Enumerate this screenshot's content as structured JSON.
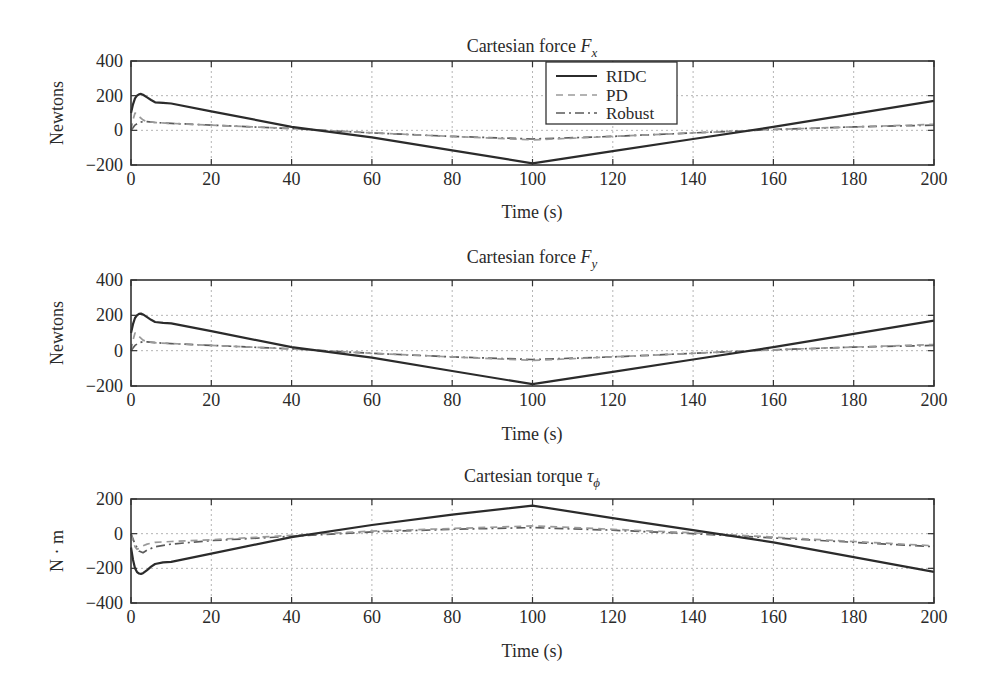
{
  "chart_data": [
    {
      "type": "line",
      "title": "Cartesian force F_x",
      "title_main": "Cartesian force ",
      "title_symbol": "F",
      "title_subscript": "x",
      "xlabel": "Time (s)",
      "ylabel": "Newtons",
      "xlim": [
        0,
        200
      ],
      "ylim": [
        -200,
        400
      ],
      "xticks": [
        0,
        20,
        40,
        60,
        80,
        100,
        120,
        140,
        160,
        180,
        200
      ],
      "yticks": [
        -200,
        0,
        200,
        400
      ],
      "ytick_labels": [
        "−200",
        "0",
        "200",
        "400"
      ],
      "grid": true,
      "legend": {
        "position": "upper center",
        "entries": [
          "RIDC",
          "PD",
          "Robust"
        ]
      },
      "series": [
        {
          "name": "RIDC",
          "style": "solid",
          "color": "#2b2b2b",
          "x": [
            0,
            0.5,
            1,
            1.5,
            2,
            2.5,
            3,
            4,
            5,
            6,
            8,
            10,
            20,
            40,
            60,
            80,
            100,
            120,
            140,
            160,
            180,
            200
          ],
          "y": [
            100,
            150,
            185,
            200,
            208,
            210,
            205,
            190,
            175,
            162,
            158,
            155,
            110,
            20,
            -40,
            -115,
            -190,
            -120,
            -50,
            20,
            95,
            170
          ]
        },
        {
          "name": "PD",
          "style": "dashed",
          "color": "#9a9a9a",
          "x": [
            0,
            0.5,
            1,
            1.5,
            2,
            3,
            4,
            6,
            10,
            20,
            40,
            60,
            80,
            100,
            120,
            140,
            160,
            180,
            200
          ],
          "y": [
            0,
            60,
            100,
            95,
            80,
            60,
            50,
            45,
            40,
            30,
            10,
            -15,
            -35,
            -55,
            -35,
            -15,
            5,
            20,
            35
          ]
        },
        {
          "name": "Robust",
          "style": "dashdot",
          "color": "#5a5a5a",
          "x": [
            0,
            0.5,
            1,
            2,
            3,
            4,
            6,
            10,
            20,
            40,
            60,
            80,
            100,
            120,
            140,
            160,
            180,
            200
          ],
          "y": [
            0,
            15,
            30,
            45,
            50,
            50,
            45,
            40,
            30,
            10,
            -15,
            -35,
            -50,
            -35,
            -15,
            5,
            20,
            30
          ]
        }
      ]
    },
    {
      "type": "line",
      "title": "Cartesian force F_y",
      "title_main": "Cartesian force ",
      "title_symbol": "F",
      "title_subscript": "y",
      "xlabel": "Time (s)",
      "ylabel": "Newtons",
      "xlim": [
        0,
        200
      ],
      "ylim": [
        -200,
        400
      ],
      "xticks": [
        0,
        20,
        40,
        60,
        80,
        100,
        120,
        140,
        160,
        180,
        200
      ],
      "yticks": [
        -200,
        0,
        200,
        400
      ],
      "ytick_labels": [
        "−200",
        "0",
        "200",
        "400"
      ],
      "grid": true,
      "series": [
        {
          "name": "RIDC",
          "style": "solid",
          "color": "#2b2b2b",
          "x": [
            0,
            0.5,
            1,
            1.5,
            2,
            2.5,
            3,
            4,
            5,
            6,
            8,
            10,
            20,
            40,
            60,
            80,
            100,
            120,
            140,
            160,
            180,
            200
          ],
          "y": [
            100,
            150,
            185,
            200,
            208,
            210,
            205,
            190,
            175,
            162,
            158,
            155,
            110,
            20,
            -40,
            -115,
            -190,
            -120,
            -50,
            20,
            95,
            170
          ]
        },
        {
          "name": "PD",
          "style": "dashed",
          "color": "#9a9a9a",
          "x": [
            0,
            0.5,
            1,
            1.5,
            2,
            3,
            4,
            6,
            10,
            20,
            40,
            60,
            80,
            100,
            120,
            140,
            160,
            180,
            200
          ],
          "y": [
            0,
            60,
            100,
            95,
            80,
            60,
            50,
            45,
            40,
            30,
            10,
            -15,
            -35,
            -55,
            -35,
            -15,
            5,
            20,
            35
          ]
        },
        {
          "name": "Robust",
          "style": "dashdot",
          "color": "#5a5a5a",
          "x": [
            0,
            0.5,
            1,
            2,
            3,
            4,
            6,
            10,
            20,
            40,
            60,
            80,
            100,
            120,
            140,
            160,
            180,
            200
          ],
          "y": [
            0,
            15,
            30,
            45,
            50,
            50,
            45,
            40,
            30,
            10,
            -15,
            -35,
            -50,
            -35,
            -15,
            5,
            20,
            30
          ]
        }
      ]
    },
    {
      "type": "line",
      "title": "Cartesian torque τ_ϕ",
      "title_main": "Cartesian torque ",
      "title_symbol": "τ",
      "title_subscript": "ϕ",
      "xlabel": "Time (s)",
      "ylabel": "N · m",
      "xlim": [
        0,
        200
      ],
      "ylim": [
        -400,
        200
      ],
      "xticks": [
        0,
        20,
        40,
        60,
        80,
        100,
        120,
        140,
        160,
        180,
        200
      ],
      "yticks": [
        -400,
        -200,
        0,
        200
      ],
      "ytick_labels": [
        "−400",
        "−200",
        "0",
        "200"
      ],
      "grid": true,
      "series": [
        {
          "name": "RIDC",
          "style": "solid",
          "color": "#2b2b2b",
          "x": [
            0,
            0.5,
            1,
            1.5,
            2,
            2.5,
            3,
            4,
            5,
            6,
            8,
            10,
            20,
            40,
            60,
            80,
            100,
            120,
            140,
            160,
            180,
            200
          ],
          "y": [
            -80,
            -150,
            -200,
            -222,
            -230,
            -232,
            -228,
            -210,
            -190,
            -175,
            -165,
            -163,
            -115,
            -20,
            50,
            110,
            162,
            90,
            20,
            -50,
            -135,
            -220
          ]
        },
        {
          "name": "PD",
          "style": "dashed",
          "color": "#9a9a9a",
          "x": [
            0,
            0.5,
            1,
            1.5,
            2,
            3,
            4,
            6,
            10,
            20,
            40,
            60,
            80,
            100,
            120,
            140,
            160,
            180,
            200
          ],
          "y": [
            0,
            -40,
            -75,
            -90,
            -85,
            -70,
            -60,
            -50,
            -45,
            -35,
            -10,
            15,
            30,
            45,
            25,
            5,
            -20,
            -45,
            -70
          ]
        },
        {
          "name": "Robust",
          "style": "dashdot",
          "color": "#5a5a5a",
          "x": [
            0,
            0.5,
            1,
            2,
            3,
            4,
            6,
            10,
            20,
            40,
            60,
            80,
            100,
            120,
            140,
            160,
            180,
            200
          ],
          "y": [
            0,
            -30,
            -60,
            -100,
            -110,
            -95,
            -75,
            -60,
            -40,
            -15,
            10,
            25,
            35,
            20,
            0,
            -25,
            -50,
            -75
          ]
        }
      ]
    }
  ]
}
